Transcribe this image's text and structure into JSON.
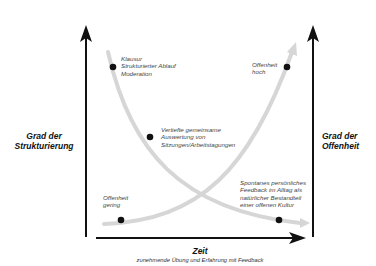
{
  "axes": {
    "left_title_line1": "Grad der",
    "left_title_line2": "Strukturierung",
    "right_title_line1": "Grad der",
    "right_title_line2": "Offenheit",
    "x_title": "Zeit",
    "x_subtitle": "zunehmende Übung und Erfahrung mit Feedback"
  },
  "curves": [
    {
      "name": "structure-curve",
      "direction": "decreasing",
      "color": "#d9d9d9"
    },
    {
      "name": "openness-curve",
      "direction": "increasing",
      "color": "#d9d9d9"
    }
  ],
  "points": {
    "klausur": {
      "line1": "Klausur",
      "line2": "Strukturierter Ablauf",
      "line3": "Moderation"
    },
    "offenheit_hoch": {
      "line1": "Offenheit",
      "line2": "hoch"
    },
    "vertiefte": {
      "line1": "Vertiefte gemeinsame",
      "line2": "Auswertung von",
      "line3": "Sitzungen/Arbeitstagungen"
    },
    "offenheit_gering": {
      "line1": "Offenheit",
      "line2": "gering"
    },
    "spontanes": {
      "line1": "Spontanes persönliches",
      "line2": "Feedback im Alltag als",
      "line3": "natürlicher Bestandteil",
      "line4": "einer offenen Kultur"
    }
  },
  "colors": {
    "axis": "#111111",
    "curve": "#d6d6d6",
    "dot": "#111111",
    "text": "#444444"
  }
}
